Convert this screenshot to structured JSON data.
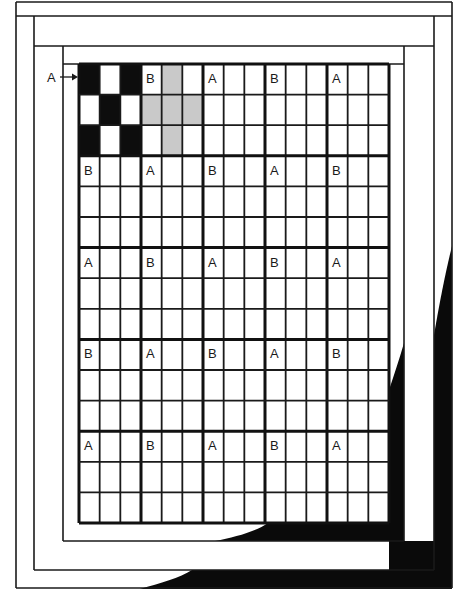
{
  "diagram": {
    "colors": {
      "background": "#ffffff",
      "line": "#1a1a1a",
      "dark_fill": "#0d0d0d",
      "gray_fill": "#c9c9c9",
      "shadow": "#0a0a0a"
    },
    "callout": {
      "label": "A",
      "arrow": "right-arrow"
    },
    "borders": {
      "count": 3,
      "description": "Three concentric log-cabin style border strips surround the center block grid"
    },
    "grid": {
      "block_rows": 5,
      "block_cols": 5,
      "cells_per_block": 3,
      "block_labels": [
        [
          "A",
          "B",
          "A",
          "B",
          "A"
        ],
        [
          "B",
          "A",
          "B",
          "A",
          "B"
        ],
        [
          "A",
          "B",
          "A",
          "B",
          "A"
        ],
        [
          "B",
          "A",
          "B",
          "A",
          "B"
        ],
        [
          "A",
          "B",
          "A",
          "B",
          "A"
        ]
      ]
    },
    "block_patterns": {
      "A": {
        "name": "Block A",
        "fill": "dark",
        "cells": [
          [
            1,
            0,
            1
          ],
          [
            0,
            1,
            0
          ],
          [
            1,
            0,
            1
          ]
        ]
      },
      "B": {
        "name": "Block B",
        "fill": "gray",
        "cells": [
          [
            0,
            1,
            0
          ],
          [
            1,
            1,
            1
          ],
          [
            0,
            1,
            0
          ]
        ]
      }
    },
    "example_block_position": {
      "row": 0,
      "col": 0,
      "shaded_blocks": [
        "0,0",
        "0,1"
      ]
    }
  }
}
